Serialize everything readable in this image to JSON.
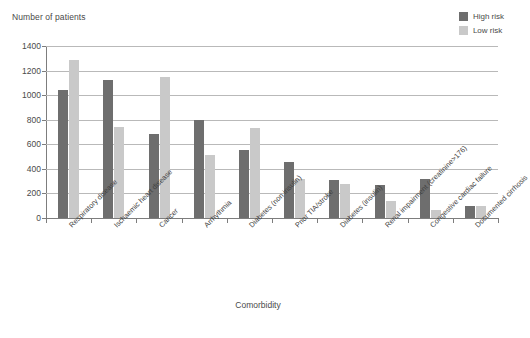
{
  "chart_data": {
    "type": "bar",
    "title": "",
    "ylabel": "Number of patients",
    "xlabel": "Comorbidity",
    "ylim": [
      0,
      1400
    ],
    "yticks": [
      0,
      200,
      400,
      600,
      800,
      1000,
      1200,
      1400
    ],
    "ytick_labels": [
      "0",
      "200",
      "400",
      "600",
      "800",
      "1000",
      "1200",
      "1400"
    ],
    "grid": true,
    "legend_position": "top-right",
    "categories": [
      "Respiratory disease",
      "Ischaemic heart disease",
      "Cancer",
      "Arrhythmia",
      "Diabetes (non insulin)",
      "Prior TIA/stroke",
      "Diabetes (insulin)",
      "Renal impairment (creatinine>176)",
      "Congestive cardiac failure",
      "Documented cirrhosis"
    ],
    "series": [
      {
        "name": "High risk",
        "color": "#6e6e6e",
        "values": [
          1040,
          1120,
          685,
          800,
          555,
          455,
          310,
          265,
          320,
          100
        ]
      },
      {
        "name": "Low risk",
        "color": "#c9c9c9",
        "values": [
          1290,
          740,
          1150,
          510,
          730,
          320,
          275,
          140,
          65,
          100
        ]
      }
    ]
  },
  "legend": {
    "items": [
      {
        "label": "High risk",
        "color": "#6e6e6e"
      },
      {
        "label": "Low risk",
        "color": "#c9c9c9"
      }
    ]
  },
  "axes": {
    "y_title": "Number of patients",
    "x_title": "Comorbidity"
  }
}
